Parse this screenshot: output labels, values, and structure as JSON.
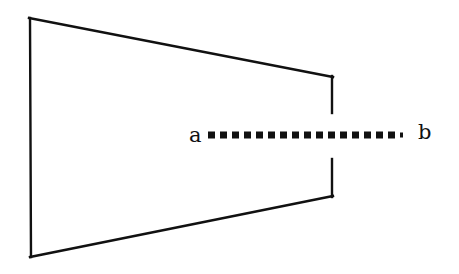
{
  "figure": {
    "kind": "geometric-diagram",
    "background_color": "#ffffff",
    "stroke_color": "#111111",
    "stroke_width": 2,
    "canvas": {
      "width": 459,
      "height": 274
    },
    "labels": {
      "left_endpoint": "a",
      "right_endpoint": "b"
    },
    "shapes": {
      "outline": {
        "name": "trapezoid-outline",
        "left_edge": {
          "x1": 30,
          "y1": 18,
          "x2": 31,
          "y2": 257
        },
        "top_edge": {
          "x1": 30,
          "y1": 18,
          "x2": 332,
          "y2": 77
        },
        "bottom_edge": {
          "x1": 31,
          "y1": 257,
          "x2": 332,
          "y2": 196
        },
        "right_edge_upper": {
          "x1": 332,
          "y1": 77,
          "x2": 332,
          "y2": 112
        },
        "right_edge_lower": {
          "x1": 332,
          "y1": 160,
          "x2": 332,
          "y2": 196
        },
        "gap": {
          "x": 332,
          "y_top": 112,
          "y_bottom": 160,
          "height": 48
        }
      },
      "dotted_line": {
        "name": "dotted-segment-ab",
        "x_start": 208,
        "x_end": 410,
        "y": 135,
        "dot_size": 7,
        "dot_spacing": 12,
        "dot_count": 17
      }
    }
  }
}
